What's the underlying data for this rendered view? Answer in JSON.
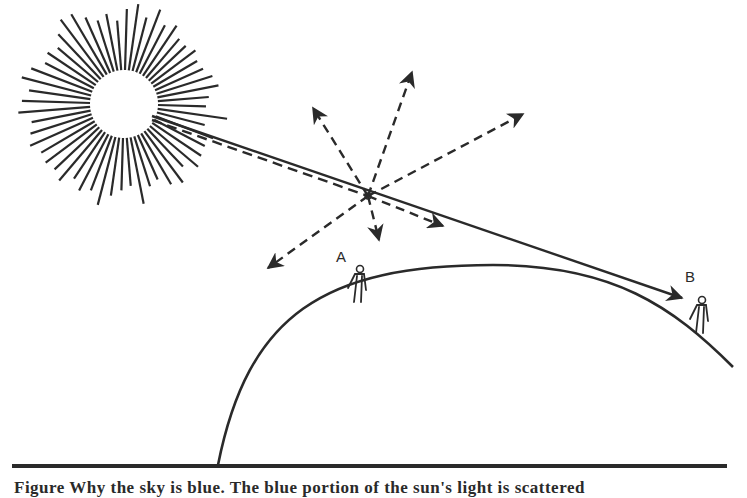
{
  "diagram": {
    "title": "Why the sky is blue",
    "colors": {
      "ink": "#2a2a2a",
      "background": "#ffffff"
    },
    "sun": {
      "cx": 124,
      "cy": 104,
      "radius": 30,
      "ray_count": 56,
      "ray_inner": 34,
      "ray_outer_min": 82,
      "ray_outer_max": 106
    },
    "sunlight_beam": {
      "style": "solid",
      "from": [
        152,
        116
      ],
      "to": [
        682,
        298
      ]
    },
    "blue_light_beam": {
      "style": "dashed",
      "from": [
        152,
        120
      ],
      "to": [
        368,
        196
      ]
    },
    "scatter_point": {
      "x": 368,
      "y": 196
    },
    "scattered_rays": [
      {
        "name": "up",
        "to": [
          412,
          72
        ]
      },
      {
        "name": "upper-left",
        "to": [
          313,
          108
        ]
      },
      {
        "name": "upper-right",
        "to": [
          523,
          114
        ]
      },
      {
        "name": "lower-left",
        "to": [
          268,
          268
        ]
      },
      {
        "name": "down",
        "to": [
          379,
          240
        ]
      },
      {
        "name": "forward",
        "to": [
          443,
          226
        ]
      }
    ],
    "observers": [
      {
        "label": "A",
        "x": 358,
        "y": 302,
        "label_x": 336,
        "label_y": 262
      },
      {
        "label": "B",
        "x": 700,
        "y": 333,
        "label_x": 685,
        "label_y": 282
      }
    ],
    "earth_arc": {
      "start": [
        218,
        465
      ],
      "peak": [
        493,
        265
      ],
      "end": [
        733,
        367
      ]
    },
    "ground_line": {
      "from": [
        12,
        466
      ],
      "to": [
        727,
        466
      ]
    },
    "caption": "Figure    Why the sky is blue.  The blue portion of the sun's light is scattered"
  }
}
